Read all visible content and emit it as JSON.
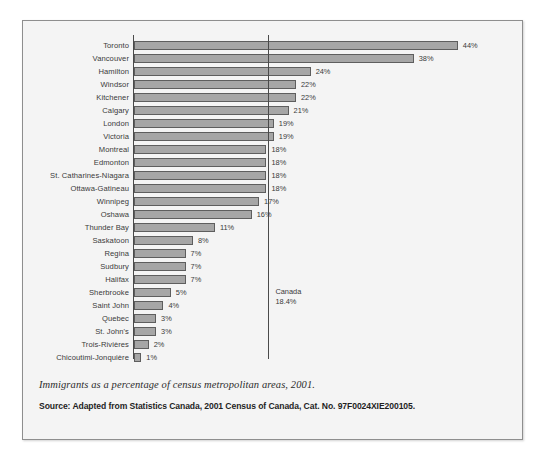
{
  "chart_data": {
    "type": "bar",
    "orientation": "horizontal",
    "title": "",
    "xlabel": "",
    "ylabel": "",
    "xlim": [
      0,
      44
    ],
    "grid": false,
    "legend": null,
    "categories": [
      "Toronto",
      "Vancouver",
      "Hamilton",
      "Windsor",
      "Kitchener",
      "Calgary",
      "London",
      "Victoria",
      "Montreal",
      "Edmonton",
      "St. Catharines-Niagara",
      "Ottawa-Gatineau",
      "Winnipeg",
      "Oshawa",
      "Thunder Bay",
      "Saskatoon",
      "Regina",
      "Sudbury",
      "Halifax",
      "Sherbrooke",
      "Saint John",
      "Quebec",
      "St. John's",
      "Trois-Rivières",
      "Chicoutimi-Jonquière"
    ],
    "values": [
      44,
      38,
      24,
      22,
      22,
      21,
      19,
      19,
      18,
      18,
      18,
      18,
      17,
      16,
      11,
      8,
      7,
      7,
      7,
      5,
      4,
      3,
      3,
      2,
      1
    ],
    "value_labels": [
      "44%",
      "38%",
      "24%",
      "22%",
      "22%",
      "21%",
      "19%",
      "19%",
      "18%",
      "18%",
      "18%",
      "18%",
      "17%",
      "16%",
      "11%",
      "8%",
      "7%",
      "7%",
      "7%",
      "5%",
      "4%",
      "3%",
      "3%",
      "2%",
      "1%"
    ],
    "reference_line": {
      "label": "Canada",
      "value_label": "18.4%",
      "value": 18.4
    },
    "bar_color": "#a6a6a6",
    "bar_border_color": "#5e5e5e",
    "axis_color": "#4a4a4a"
  },
  "caption": "Immigrants as a percentage of census metropolitan areas, 2001.",
  "source": "Source: Adapted from Statistics Canada, 2001 Census of Canada, Cat. No. 97F0024XIE200105."
}
